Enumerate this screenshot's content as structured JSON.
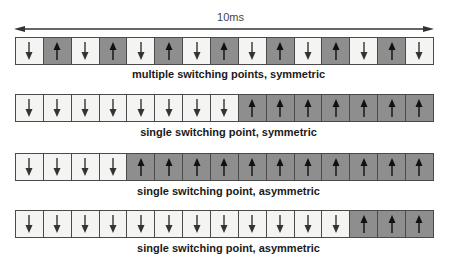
{
  "timeline": {
    "label": "10ms",
    "direction": "bidirectional"
  },
  "colors": {
    "down_cell": "#f4f4f2",
    "up_cell": "#8e8e8e",
    "border": "#4a4a4a",
    "arrow": "#333333"
  },
  "rows": [
    {
      "caption": "multiple switching points, symmetric",
      "cells": [
        "down",
        "up",
        "down",
        "up",
        "down",
        "up",
        "down",
        "up",
        "down",
        "up",
        "down",
        "up",
        "down",
        "up",
        "down"
      ]
    },
    {
      "caption": "single switching point, symmetric",
      "cells": [
        "down",
        "down",
        "down",
        "down",
        "down",
        "down",
        "down",
        "down",
        "up",
        "up",
        "up",
        "up",
        "up",
        "up",
        "up"
      ]
    },
    {
      "caption": "single switching point, asymmetric",
      "cells": [
        "down",
        "down",
        "down",
        "down",
        "up",
        "up",
        "up",
        "up",
        "up",
        "up",
        "up",
        "up",
        "up",
        "up",
        "up"
      ]
    },
    {
      "caption": "single switching point, asymmetric",
      "cells": [
        "down",
        "down",
        "down",
        "down",
        "down",
        "down",
        "down",
        "down",
        "down",
        "down",
        "down",
        "down",
        "up",
        "up",
        "up"
      ]
    }
  ]
}
